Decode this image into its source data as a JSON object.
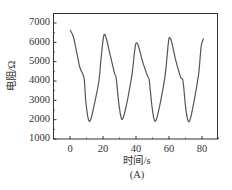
{
  "chart_data": {
    "type": "line",
    "title": "",
    "xlabel": "时间/s",
    "ylabel": "电阻/Ω",
    "caption": "(A)",
    "xlim": [
      -10,
      90
    ],
    "ylim": [
      1000,
      7000
    ],
    "xticks": [
      0,
      20,
      40,
      60,
      80
    ],
    "yticks": [
      1000,
      2000,
      3000,
      4000,
      5000,
      6000,
      7000
    ],
    "grid": false,
    "legend": null,
    "series": [
      {
        "name": "resistance",
        "color": "#555555",
        "x": [
          0,
          2,
          4,
          6,
          8.5,
          9.5,
          11,
          12.5,
          15,
          17.5,
          19,
          20.5,
          22,
          24.5,
          27,
          28,
          29.5,
          31,
          32.5,
          35,
          37.5,
          39,
          40,
          41.5,
          44,
          47,
          48,
          49.5,
          51,
          52.5,
          55,
          57.5,
          59,
          60,
          61.5,
          64,
          67,
          68.5,
          70,
          71.5,
          73,
          75.5,
          78,
          79.5,
          81
        ],
        "values": [
          6650,
          6300,
          5500,
          4700,
          4150,
          3000,
          2050,
          2000,
          2900,
          4000,
          5300,
          6350,
          6200,
          5300,
          4400,
          4150,
          2900,
          2100,
          2150,
          3100,
          4300,
          5400,
          5950,
          5800,
          5000,
          4250,
          4050,
          2800,
          2000,
          2050,
          3000,
          4200,
          5400,
          6200,
          6050,
          5100,
          4200,
          4000,
          2700,
          1950,
          2050,
          3100,
          4400,
          5800,
          6200
        ]
      }
    ]
  }
}
